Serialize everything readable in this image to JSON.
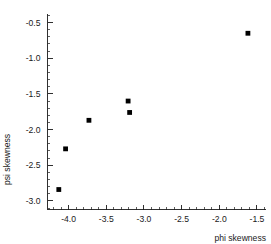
{
  "chart_data": {
    "type": "scatter",
    "title": "",
    "xlabel": "phi skewness",
    "ylabel": "psi skewness",
    "xlim": [
      -4.28,
      -1.38
    ],
    "ylim": [
      -3.12,
      -0.38
    ],
    "grid": false,
    "legend": "none",
    "marker": "filled-square",
    "marker_color": "#000000",
    "xticks": [
      -4.0,
      -3.5,
      -3.0,
      -2.5,
      -2.0,
      -1.5
    ],
    "xticklabels": [
      "-4.0",
      "-3.5",
      "-3.0",
      "-2.5",
      "-2.0",
      "-1.5"
    ],
    "yticks": [
      -0.5,
      -1.0,
      -1.5,
      -2.0,
      -2.5,
      -3.0
    ],
    "yticklabels": [
      "-0.5",
      "-1.0",
      "-1.5",
      "-2.0",
      "-2.5",
      "-3.0"
    ],
    "x_minor_tick_interval": 0.1,
    "y_minor_tick_interval": 0.1,
    "points": [
      {
        "x": -4.13,
        "y": -2.84
      },
      {
        "x": -4.04,
        "y": -2.27
      },
      {
        "x": -3.73,
        "y": -1.87
      },
      {
        "x": -3.21,
        "y": -1.6
      },
      {
        "x": -3.19,
        "y": -1.76
      },
      {
        "x": -1.62,
        "y": -0.65
      }
    ]
  },
  "axes": {
    "x_axis_name": "phi-skewness-axis",
    "y_axis_name": "psi-skewness-axis"
  }
}
